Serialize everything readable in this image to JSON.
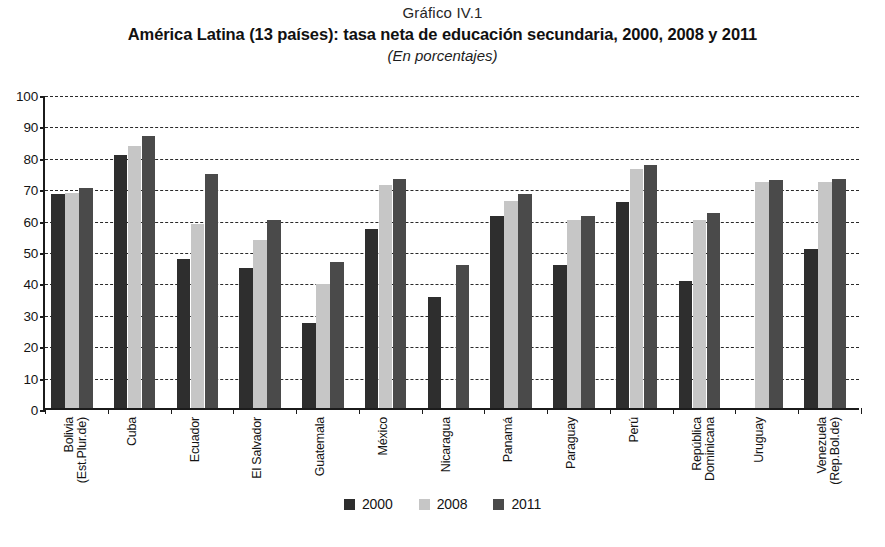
{
  "header": {
    "chart_number": "Gráfico IV.1",
    "title": "América Latina (13 países): tasa neta de educación secundaria, 2000, 2008 y 2011",
    "subtitle": "(En porcentajes)"
  },
  "legend": {
    "position": "bottom-center",
    "items": [
      {
        "label": "2000",
        "color": "#2e2e2e",
        "swatch_name": "legend-swatch-2000"
      },
      {
        "label": "2008",
        "color": "#c6c6c6",
        "swatch_name": "legend-swatch-2008"
      },
      {
        "label": "2011",
        "color": "#4a4a4a",
        "swatch_name": "legend-swatch-2011"
      }
    ]
  },
  "source": {
    "text": ""
  },
  "chart_data": {
    "type": "bar",
    "title": "América Latina (13 países): tasa neta de educación secundaria, 2000, 2008 y 2011",
    "subtitle": "(En porcentajes)",
    "chart_number": "Gráfico IV.1",
    "xlabel": "",
    "ylabel": "",
    "ylim": [
      0,
      100
    ],
    "ytick_step": 10,
    "yticks": [
      0,
      10,
      20,
      30,
      40,
      50,
      60,
      70,
      80,
      90,
      100
    ],
    "grid": "horizontal-dashed",
    "legend_position": "bottom-center",
    "categories": [
      "Bolivia\n(Est.Plur.de)",
      "Cuba",
      "Ecuador",
      "El Salvador",
      "Guatemala",
      "México",
      "Nicaragua",
      "Panamá",
      "Paraguay",
      "Perú",
      "República\nDominicana",
      "Uruguay",
      "Venezuela\n(Rep.Bol.de)"
    ],
    "category_lines": [
      [
        "Bolivia",
        "(Est.Plur.de)"
      ],
      [
        "Cuba",
        ""
      ],
      [
        "Ecuador",
        ""
      ],
      [
        "El Salvador",
        ""
      ],
      [
        "Guatemala",
        ""
      ],
      [
        "México",
        ""
      ],
      [
        "Nicaragua",
        ""
      ],
      [
        "Panamá",
        ""
      ],
      [
        "Paraguay",
        ""
      ],
      [
        "Perú",
        ""
      ],
      [
        "República",
        "Dominicana"
      ],
      [
        "Uruguay",
        ""
      ],
      [
        "Venezuela",
        "(Rep.Bol.de)"
      ]
    ],
    "series": [
      {
        "name": "2000",
        "color": "#2e2e2e",
        "values": [
          68,
          80.5,
          47.5,
          44.5,
          27,
          57,
          35.5,
          61,
          45.5,
          65.5,
          40.5,
          null,
          50.5
        ]
      },
      {
        "name": "2008",
        "color": "#c6c6c6",
        "values": [
          68.5,
          83.5,
          58.5,
          53.5,
          39.5,
          71,
          null,
          66,
          60,
          76,
          60,
          72,
          72
        ]
      },
      {
        "name": "2011",
        "color": "#4a4a4a",
        "values": [
          70,
          86.5,
          74.5,
          60,
          46.5,
          73,
          45.5,
          68,
          61,
          77.5,
          62,
          72.5,
          73
        ]
      }
    ]
  }
}
